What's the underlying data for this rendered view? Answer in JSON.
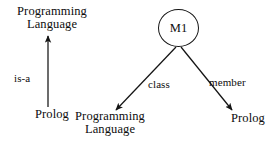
{
  "diagram": {
    "title_text": "",
    "background_color": "#ffffff",
    "stroke_color": "#141414",
    "text_color": "#0d0d0d",
    "left_subgraph": {
      "nodes": [
        {
          "id": "pl-top",
          "label": "Programming\nLanguage",
          "shape": "text"
        },
        {
          "id": "prolog-bottom-left",
          "label": "Prolog",
          "shape": "text"
        }
      ],
      "edges": [
        {
          "id": "is-a-edge",
          "label": "is-a",
          "from": "prolog-bottom-left",
          "to": "pl-top",
          "direction": "up",
          "arrowhead": true
        }
      ]
    },
    "right_subgraph": {
      "nodes": [
        {
          "id": "m1",
          "label": "M1",
          "shape": "circle"
        },
        {
          "id": "pl-bottom",
          "label": "Programming\nLanguage",
          "shape": "text"
        },
        {
          "id": "prolog-bottom-right",
          "label": "Prolog",
          "shape": "text"
        }
      ],
      "edges": [
        {
          "id": "class-edge",
          "label": "class",
          "from": "m1",
          "to": "pl-bottom",
          "direction": "down-left",
          "arrowhead": true
        },
        {
          "id": "member-edge",
          "label": "member",
          "from": "m1",
          "to": "prolog-bottom-right",
          "direction": "down-right",
          "arrowhead": true
        }
      ]
    }
  }
}
